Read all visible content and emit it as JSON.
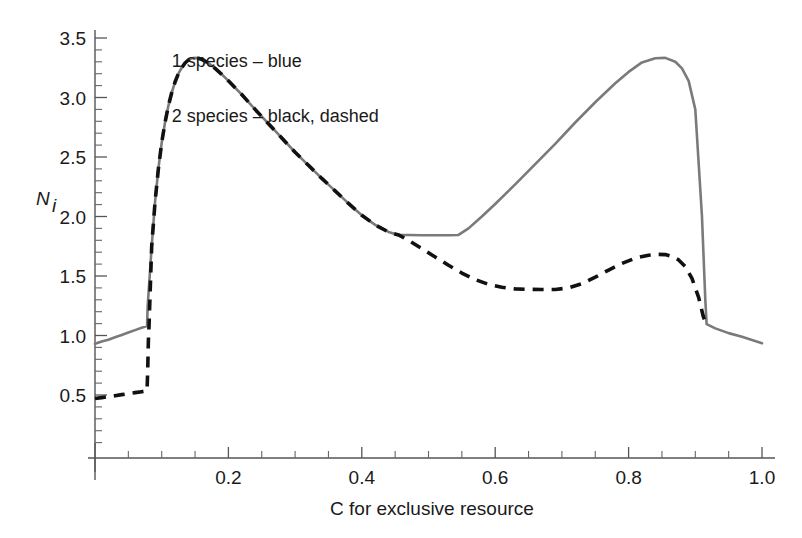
{
  "chart_data": {
    "type": "line",
    "title": "",
    "xlabel": "C for exclusive resource",
    "ylabel": "N",
    "ylabel_sub": "i",
    "xlim": [
      0.0,
      1.0
    ],
    "ylim": [
      0.0,
      3.6
    ],
    "grid": false,
    "legend_position": "inside-lower-left",
    "xticks": [
      0.2,
      0.4,
      0.6,
      0.8,
      1.0
    ],
    "xtick_labels": [
      "0.2",
      "0.4",
      "0.6",
      "0.8",
      "1.0"
    ],
    "xticks_minor": [
      0.05,
      0.1,
      0.15,
      0.25,
      0.3,
      0.35,
      0.45,
      0.5,
      0.55,
      0.65,
      0.7,
      0.75,
      0.85,
      0.9,
      0.95
    ],
    "yticks": [
      0.5,
      1.0,
      1.5,
      2.0,
      2.5,
      3.0,
      3.5
    ],
    "ytick_labels": [
      "0.5",
      "1.0",
      "1.5",
      "2.0",
      "2.5",
      "3.0",
      "3.5"
    ],
    "yticks_minor": [
      0.1,
      0.2,
      0.3,
      0.4,
      0.6,
      0.7,
      0.8,
      0.9,
      1.1,
      1.2,
      1.3,
      1.4,
      1.6,
      1.7,
      1.8,
      1.9,
      2.1,
      2.2,
      2.3,
      2.4,
      2.6,
      2.7,
      2.8,
      2.9,
      3.1,
      3.2,
      3.3,
      3.4
    ],
    "series": [
      {
        "name": "1 species",
        "style": "solid",
        "color": "#7a7a7a",
        "x": [
          0.0,
          0.01,
          0.02,
          0.03,
          0.04,
          0.05,
          0.06,
          0.07,
          0.078,
          0.079,
          0.085,
          0.09,
          0.095,
          0.1,
          0.105,
          0.11,
          0.115,
          0.12,
          0.125,
          0.13,
          0.135,
          0.14,
          0.145,
          0.15,
          0.155,
          0.16,
          0.17,
          0.18,
          0.19,
          0.2,
          0.22,
          0.24,
          0.26,
          0.28,
          0.3,
          0.32,
          0.34,
          0.36,
          0.38,
          0.4,
          0.42,
          0.44,
          0.455,
          0.47,
          0.49,
          0.51,
          0.53,
          0.545,
          0.56,
          0.58,
          0.6,
          0.63,
          0.66,
          0.69,
          0.72,
          0.75,
          0.78,
          0.8,
          0.82,
          0.84,
          0.855,
          0.87,
          0.88,
          0.89,
          0.9,
          0.91,
          0.915,
          0.917,
          0.93,
          0.95,
          0.97,
          1.0
        ],
        "y": [
          0.93,
          0.95,
          0.965,
          0.985,
          1.005,
          1.025,
          1.045,
          1.065,
          1.08,
          1.25,
          1.75,
          2.12,
          2.4,
          2.62,
          2.79,
          2.93,
          3.04,
          3.13,
          3.2,
          3.25,
          3.29,
          3.315,
          3.33,
          3.333,
          3.33,
          3.32,
          3.29,
          3.245,
          3.195,
          3.14,
          3.025,
          2.9,
          2.78,
          2.66,
          2.54,
          2.43,
          2.32,
          2.215,
          2.11,
          2.01,
          1.93,
          1.87,
          1.845,
          1.845,
          1.843,
          1.842,
          1.842,
          1.845,
          1.9,
          2.0,
          2.105,
          2.27,
          2.44,
          2.61,
          2.79,
          2.96,
          3.12,
          3.215,
          3.295,
          3.33,
          3.333,
          3.3,
          3.245,
          3.14,
          2.9,
          2.0,
          1.3,
          1.095,
          1.06,
          1.02,
          0.99,
          0.935
        ]
      },
      {
        "name": "2 species",
        "style": "dashed",
        "color": "#111111",
        "x": [
          0.0,
          0.01,
          0.02,
          0.03,
          0.04,
          0.05,
          0.06,
          0.07,
          0.078,
          0.079,
          0.08,
          0.081,
          0.085,
          0.09,
          0.095,
          0.1,
          0.105,
          0.11,
          0.115,
          0.12,
          0.125,
          0.13,
          0.135,
          0.14,
          0.145,
          0.15,
          0.155,
          0.16,
          0.17,
          0.18,
          0.19,
          0.2,
          0.22,
          0.24,
          0.26,
          0.28,
          0.3,
          0.32,
          0.34,
          0.36,
          0.38,
          0.4,
          0.42,
          0.44,
          0.455,
          0.47,
          0.49,
          0.51,
          0.53,
          0.55,
          0.57,
          0.59,
          0.61,
          0.63,
          0.65,
          0.67,
          0.69,
          0.71,
          0.73,
          0.75,
          0.77,
          0.79,
          0.81,
          0.83,
          0.845,
          0.855,
          0.865,
          0.875,
          0.885,
          0.895,
          0.905,
          0.912,
          0.916
        ],
        "y": [
          0.47,
          0.478,
          0.486,
          0.494,
          0.503,
          0.512,
          0.52,
          0.528,
          0.535,
          0.7,
          0.95,
          1.08,
          1.75,
          2.12,
          2.4,
          2.62,
          2.79,
          2.93,
          3.04,
          3.13,
          3.2,
          3.25,
          3.29,
          3.315,
          3.33,
          3.333,
          3.33,
          3.32,
          3.29,
          3.245,
          3.195,
          3.14,
          3.025,
          2.9,
          2.78,
          2.66,
          2.54,
          2.43,
          2.32,
          2.215,
          2.11,
          2.01,
          1.93,
          1.87,
          1.845,
          1.8,
          1.73,
          1.66,
          1.59,
          1.525,
          1.47,
          1.43,
          1.405,
          1.392,
          1.388,
          1.386,
          1.387,
          1.4,
          1.435,
          1.49,
          1.55,
          1.605,
          1.65,
          1.675,
          1.682,
          1.68,
          1.665,
          1.635,
          1.58,
          1.48,
          1.32,
          1.16,
          1.095
        ]
      }
    ],
    "annotations": [
      {
        "text": "1 species – blue",
        "x": 0.115,
        "y": 0.905
      },
      {
        "text": "2 species – black, dashed",
        "x": 0.115,
        "y": 0.775
      }
    ]
  },
  "axes": {
    "y_label_main": "N",
    "y_label_sub": "i",
    "x_label": "C for exclusive resource"
  },
  "colors": {
    "solid_series": "#7a7a7a",
    "dashed_series": "#111111",
    "axis": "#555555",
    "text": "#1a1a1a",
    "background": "#ffffff"
  }
}
